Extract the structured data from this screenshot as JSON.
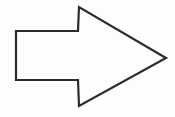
{
  "canvas": {
    "width": 175,
    "height": 117,
    "background_color": "#fdfdfd"
  },
  "figure": {
    "name": "right-pointing-arrow",
    "stroke_color": "#2b2b2b",
    "fill_color": "none",
    "stroke_width": 2.2,
    "direction": "right",
    "vertices": [
      {
        "label": "shaft-top-left",
        "x": 16,
        "y": 31
      },
      {
        "label": "shaft-top-right",
        "x": 78,
        "y": 31
      },
      {
        "label": "barb-top-tip",
        "x": 79,
        "y": 7
      },
      {
        "label": "arrow-point",
        "x": 166,
        "y": 58
      },
      {
        "label": "barb-bottom-tip",
        "x": 79,
        "y": 106
      },
      {
        "label": "shaft-bottom-right",
        "x": 78,
        "y": 80
      },
      {
        "label": "shaft-bottom-left",
        "x": 16,
        "y": 80
      }
    ],
    "path": "M 16 31 L 78 31 L 79 7 L 166 58 L 79 106 L 78 80 L 16 80 Z"
  }
}
